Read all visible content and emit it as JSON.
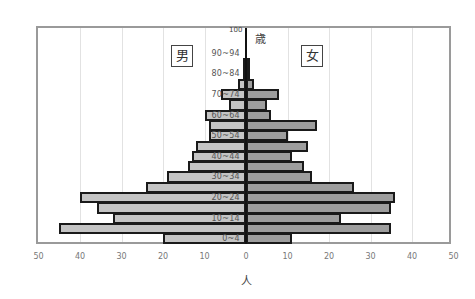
{
  "chart_data": {
    "type": "bar",
    "subtype": "population-pyramid",
    "title": "",
    "xlabel": "人",
    "ylabel": "歳",
    "y_top_label": "100",
    "legend": {
      "male": "男",
      "female": "女"
    },
    "xlim": [
      -50,
      50
    ],
    "x_ticks": [
      "50",
      "40",
      "30",
      "20",
      "10",
      "0",
      "10",
      "20",
      "30",
      "40",
      "50"
    ],
    "grid": true,
    "categories": [
      "0~4",
      "5~9",
      "10~14",
      "15~19",
      "20~24",
      "25~29",
      "30~34",
      "35~39",
      "40~44",
      "45~49",
      "50~54",
      "55~59",
      "60~64",
      "65~69",
      "70~74",
      "75~79",
      "80~84",
      "85~89",
      "90~94",
      "95~99"
    ],
    "visible_age_labels": [
      "0~4",
      "10~14",
      "20~24",
      "30~34",
      "40~44",
      "50~54",
      "60~64",
      "70~74",
      "80~84",
      "90~94"
    ],
    "series": [
      {
        "name": "男",
        "color": "#c4c4c4",
        "values": [
          20,
          45,
          32,
          36,
          40,
          24,
          19,
          14,
          13,
          12,
          9,
          9,
          10,
          4,
          6,
          2,
          0.5,
          0.5,
          0,
          0
        ]
      },
      {
        "name": "女",
        "color": "#9e9e9e",
        "values": [
          11,
          35,
          23,
          35,
          36,
          26,
          16,
          14,
          11,
          15,
          10,
          17,
          6,
          5,
          8,
          2,
          1,
          1,
          0,
          0
        ]
      }
    ]
  }
}
